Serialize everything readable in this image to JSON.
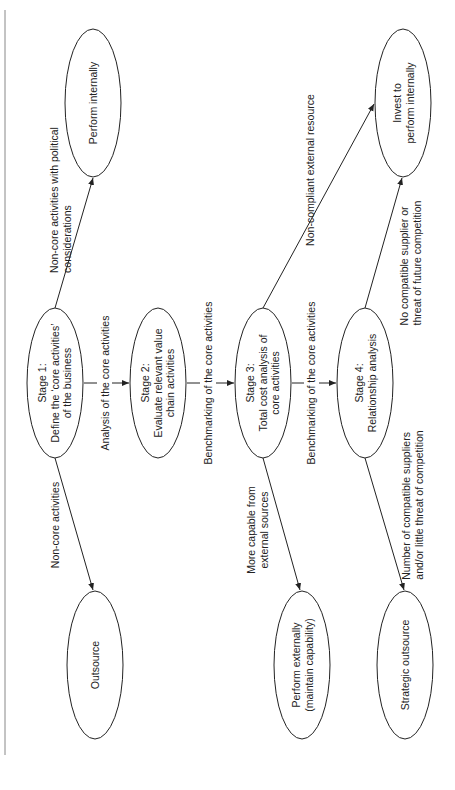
{
  "nodes": {
    "stage1": {
      "line1": "Stage 1:",
      "line2": "Define the ‘core activities’",
      "line3": "of the business"
    },
    "stage2": {
      "line1": "Stage 2:",
      "line2": "Evaluate relevant value",
      "line3": "chain activities"
    },
    "stage3": {
      "line1": "Stage 3:",
      "line2": "Total cost analysis of",
      "line3": "core activities"
    },
    "stage4": {
      "line1": "Stage 4:",
      "line2": "Relationship analysis"
    },
    "perform_internally": {
      "line1": "Perform internally"
    },
    "invest_internally": {
      "line1": "Invest to",
      "line2": "perform internally"
    },
    "outsource": {
      "line1": "Outsource"
    },
    "perform_externally": {
      "line1": "Perform externally",
      "line2": "(maintain capability)"
    },
    "strategic_outsource": {
      "line1": "Strategic outsource"
    }
  },
  "edges": {
    "s1_to_s2": "Analysis of the core activities",
    "s2_to_s3": "Benchmarking of the core activities",
    "s3_to_s4": "Benchmarking of the core activities",
    "s1_to_perform_internally": {
      "line1": "Non-core activities with political",
      "line2": "considerations"
    },
    "s1_to_outsource": "Non-core activities",
    "s3_to_invest": "Non-compliant external resource",
    "s3_to_perform_externally": {
      "line1": "More capable from",
      "line2": "external sources"
    },
    "s4_to_invest": {
      "line1": "No compatible supplier or",
      "line2": "threat of future competition"
    },
    "s4_to_strategic": {
      "line1": "Number of compatible suppliers",
      "line2": "and/or little threat of competition"
    }
  }
}
